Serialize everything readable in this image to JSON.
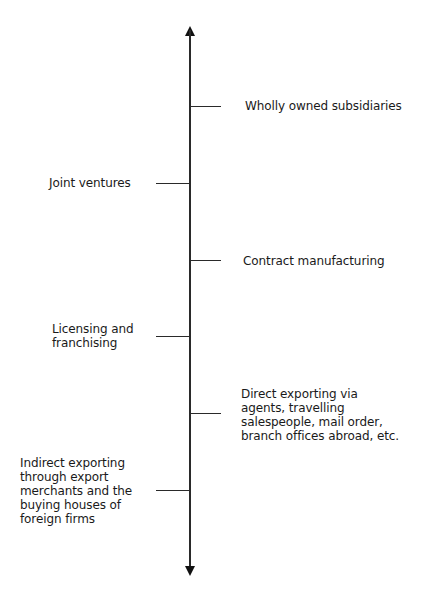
{
  "diagram": {
    "type": "vertical-continuum",
    "axis": {
      "orientation": "vertical",
      "arrow_top": "up-arrow-icon",
      "arrow_bottom": "down-arrow-icon",
      "color": "#2a2a2a"
    },
    "items": [
      {
        "id": "wholly-owned-subsidiaries",
        "side": "right",
        "text": "Wholly owned subsidiaries"
      },
      {
        "id": "joint-ventures",
        "side": "left",
        "text": "Joint ventures"
      },
      {
        "id": "contract-manufacturing",
        "side": "right",
        "text": "Contract manufacturing"
      },
      {
        "id": "licensing-franchising",
        "side": "left",
        "text": "Licensing and\nfranchising"
      },
      {
        "id": "direct-exporting",
        "side": "right",
        "text": "Direct exporting via\nagents, travelling\nsalespeople, mail order,\nbranch offices abroad, etc."
      },
      {
        "id": "indirect-exporting",
        "side": "left",
        "text": "Indirect exporting\nthrough export\nmerchants and the\nbuying houses of\nforeign firms"
      }
    ]
  }
}
